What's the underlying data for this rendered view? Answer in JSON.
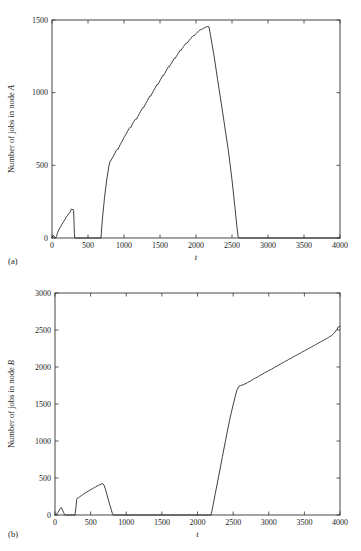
{
  "figure": {
    "panels": [
      {
        "caption": "(a)",
        "name": "panel-a"
      },
      {
        "caption": "(b)",
        "name": "panel-b"
      }
    ]
  },
  "chart_data": [
    {
      "type": "line",
      "title": "",
      "xlabel": "t",
      "ylabel": "Number of jobs in node A",
      "ylabel_parts": {
        "prefix": "Number of jobs in node ",
        "italic": "A"
      },
      "xlim": [
        0,
        4000
      ],
      "ylim": [
        0,
        1500
      ],
      "xticks": [
        0,
        500,
        1000,
        1500,
        2000,
        2500,
        3000,
        3500,
        4000
      ],
      "yticks": [
        0,
        500,
        1000,
        1500
      ],
      "xticklabels": [
        "0",
        "500",
        "1000",
        "1500",
        "2000",
        "2500",
        "3000",
        "3500",
        "4000"
      ],
      "yticklabels": [
        "0",
        "500",
        "1000",
        "1500"
      ],
      "grid": false,
      "legend": "none",
      "series": [
        {
          "name": "jobs-in-node-A",
          "color": "#2a2a2a",
          "points": [
            [
              0,
              0
            ],
            [
              20,
              18
            ],
            [
              40,
              5
            ],
            [
              55,
              2
            ],
            [
              62,
              10
            ],
            [
              80,
              40
            ],
            [
              100,
              62
            ],
            [
              120,
              78
            ],
            [
              140,
              96
            ],
            [
              160,
              112
            ],
            [
              180,
              128
            ],
            [
              200,
              145
            ],
            [
              215,
              155
            ],
            [
              230,
              168
            ],
            [
              245,
              172
            ],
            [
              255,
              182
            ],
            [
              265,
              196
            ],
            [
              275,
              200
            ],
            [
              285,
              192
            ],
            [
              292,
              198
            ],
            [
              300,
              190
            ],
            [
              305,
              120
            ],
            [
              310,
              40
            ],
            [
              315,
              5
            ],
            [
              320,
              0
            ],
            [
              400,
              0
            ],
            [
              500,
              0
            ],
            [
              600,
              0
            ],
            [
              660,
              0
            ],
            [
              680,
              0
            ],
            [
              700,
              130
            ],
            [
              730,
              280
            ],
            [
              760,
              400
            ],
            [
              790,
              495
            ],
            [
              805,
              528
            ],
            [
              815,
              530
            ],
            [
              830,
              545
            ],
            [
              850,
              560
            ],
            [
              870,
              580
            ],
            [
              890,
              600
            ],
            [
              905,
              610
            ],
            [
              915,
              608
            ],
            [
              930,
              625
            ],
            [
              950,
              645
            ],
            [
              970,
              662
            ],
            [
              990,
              682
            ],
            [
              1010,
              700
            ],
            [
              1030,
              716
            ],
            [
              1050,
              735
            ],
            [
              1070,
              752
            ],
            [
              1085,
              762
            ],
            [
              1095,
              760
            ],
            [
              1110,
              778
            ],
            [
              1130,
              796
            ],
            [
              1150,
              812
            ],
            [
              1165,
              820
            ],
            [
              1175,
              818
            ],
            [
              1190,
              834
            ],
            [
              1210,
              852
            ],
            [
              1230,
              870
            ],
            [
              1250,
              888
            ],
            [
              1262,
              898
            ],
            [
              1272,
              896
            ],
            [
              1285,
              910
            ],
            [
              1305,
              928
            ],
            [
              1325,
              946
            ],
            [
              1345,
              964
            ],
            [
              1360,
              978
            ],
            [
              1370,
              976
            ],
            [
              1385,
              990
            ],
            [
              1405,
              1008
            ],
            [
              1425,
              1026
            ],
            [
              1445,
              1044
            ],
            [
              1460,
              1058
            ],
            [
              1470,
              1055
            ],
            [
              1485,
              1070
            ],
            [
              1505,
              1088
            ],
            [
              1525,
              1106
            ],
            [
              1540,
              1120
            ],
            [
              1550,
              1118
            ],
            [
              1565,
              1132
            ],
            [
              1585,
              1150
            ],
            [
              1605,
              1168
            ],
            [
              1620,
              1180
            ],
            [
              1630,
              1178
            ],
            [
              1645,
              1192
            ],
            [
              1665,
              1208
            ],
            [
              1685,
              1225
            ],
            [
              1700,
              1238
            ],
            [
              1712,
              1236
            ],
            [
              1725,
              1248
            ],
            [
              1745,
              1264
            ],
            [
              1765,
              1280
            ],
            [
              1780,
              1292
            ],
            [
              1792,
              1290
            ],
            [
              1805,
              1302
            ],
            [
              1825,
              1316
            ],
            [
              1845,
              1330
            ],
            [
              1860,
              1340
            ],
            [
              1872,
              1338
            ],
            [
              1885,
              1348
            ],
            [
              1905,
              1360
            ],
            [
              1925,
              1372
            ],
            [
              1945,
              1384
            ],
            [
              1960,
              1392
            ],
            [
              1972,
              1390
            ],
            [
              1985,
              1398
            ],
            [
              2005,
              1408
            ],
            [
              2025,
              1418
            ],
            [
              2045,
              1428
            ],
            [
              2060,
              1434
            ],
            [
              2075,
              1432
            ],
            [
              2090,
              1438
            ],
            [
              2110,
              1444
            ],
            [
              2130,
              1450
            ],
            [
              2150,
              1453
            ],
            [
              2165,
              1455
            ],
            [
              2180,
              1453
            ],
            [
              2200,
              1400
            ],
            [
              2250,
              1255
            ],
            [
              2300,
              1090
            ],
            [
              2350,
              930
            ],
            [
              2400,
              765
            ],
            [
              2450,
              600
            ],
            [
              2500,
              400
            ],
            [
              2540,
              215
            ],
            [
              2570,
              70
            ],
            [
              2585,
              8
            ],
            [
              2595,
              0
            ],
            [
              2700,
              0
            ],
            [
              3000,
              0
            ],
            [
              3500,
              0
            ],
            [
              4000,
              0
            ]
          ]
        }
      ]
    },
    {
      "type": "line",
      "title": "",
      "xlabel": "t",
      "ylabel": "Number of jobs in node B",
      "ylabel_parts": {
        "prefix": "Number of jobs in node ",
        "italic": "B"
      },
      "xlim": [
        0,
        4000
      ],
      "ylim": [
        0,
        3000
      ],
      "xticks": [
        0,
        500,
        1000,
        1500,
        2000,
        2500,
        3000,
        3500,
        4000
      ],
      "yticks": [
        0,
        500,
        1000,
        1500,
        2000,
        2500,
        3000
      ],
      "xticklabels": [
        "0",
        "500",
        "1000",
        "1500",
        "2000",
        "2500",
        "3000",
        "3500",
        "4000"
      ],
      "yticklabels": [
        "0",
        "500",
        "1000",
        "1500",
        "2000",
        "2500",
        "3000"
      ],
      "grid": false,
      "legend": "none",
      "series": [
        {
          "name": "jobs-in-node-B",
          "color": "#2a2a2a",
          "points": [
            [
              0,
              0
            ],
            [
              30,
              20
            ],
            [
              55,
              55
            ],
            [
              75,
              90
            ],
            [
              90,
              98
            ],
            [
              105,
              70
            ],
            [
              120,
              35
            ],
            [
              132,
              8
            ],
            [
              140,
              0
            ],
            [
              200,
              0
            ],
            [
              260,
              0
            ],
            [
              280,
              0
            ],
            [
              295,
              110
            ],
            [
              305,
              210
            ],
            [
              315,
              228
            ],
            [
              330,
              232
            ],
            [
              350,
              248
            ],
            [
              370,
              262
            ],
            [
              390,
              276
            ],
            [
              410,
              290
            ],
            [
              430,
              302
            ],
            [
              450,
              312
            ],
            [
              470,
              324
            ],
            [
              490,
              336
            ],
            [
              510,
              348
            ],
            [
              530,
              358
            ],
            [
              550,
              368
            ],
            [
              570,
              380
            ],
            [
              590,
              392
            ],
            [
              610,
              400
            ],
            [
              630,
              410
            ],
            [
              650,
              418
            ],
            [
              665,
              424
            ],
            [
              675,
              420
            ],
            [
              690,
              400
            ],
            [
              710,
              340
            ],
            [
              730,
              272
            ],
            [
              750,
              200
            ],
            [
              770,
              135
            ],
            [
              790,
              70
            ],
            [
              805,
              22
            ],
            [
              815,
              2
            ],
            [
              822,
              0
            ],
            [
              900,
              0
            ],
            [
              1000,
              0
            ],
            [
              1200,
              0
            ],
            [
              1500,
              0
            ],
            [
              1800,
              0
            ],
            [
              2000,
              0
            ],
            [
              2150,
              0
            ],
            [
              2190,
              0
            ],
            [
              2210,
              90
            ],
            [
              2250,
              290
            ],
            [
              2300,
              540
            ],
            [
              2350,
              790
            ],
            [
              2400,
              1040
            ],
            [
              2450,
              1280
            ],
            [
              2500,
              1490
            ],
            [
              2550,
              1680
            ],
            [
              2580,
              1738
            ],
            [
              2600,
              1748
            ],
            [
              2640,
              1760
            ],
            [
              2680,
              1778
            ],
            [
              2700,
              1788
            ],
            [
              2720,
              1800
            ],
            [
              2740,
              1808
            ],
            [
              2760,
              1820
            ],
            [
              2780,
              1832
            ],
            [
              2800,
              1845
            ],
            [
              2820,
              1855
            ],
            [
              2840,
              1862
            ],
            [
              2860,
              1875
            ],
            [
              2880,
              1888
            ],
            [
              2900,
              1898
            ],
            [
              2920,
              1908
            ],
            [
              2940,
              1920
            ],
            [
              2960,
              1930
            ],
            [
              2980,
              1940
            ],
            [
              3000,
              1952
            ],
            [
              3020,
              1962
            ],
            [
              3040,
              1970
            ],
            [
              3060,
              1982
            ],
            [
              3080,
              1995
            ],
            [
              3100,
              2005
            ],
            [
              3120,
              2015
            ],
            [
              3140,
              2026
            ],
            [
              3160,
              2038
            ],
            [
              3180,
              2048
            ],
            [
              3200,
              2058
            ],
            [
              3220,
              2070
            ],
            [
              3240,
              2080
            ],
            [
              3260,
              2090
            ],
            [
              3280,
              2102
            ],
            [
              3300,
              2112
            ],
            [
              3320,
              2122
            ],
            [
              3340,
              2134
            ],
            [
              3360,
              2145
            ],
            [
              3380,
              2155
            ],
            [
              3400,
              2165
            ],
            [
              3420,
              2176
            ],
            [
              3440,
              2186
            ],
            [
              3460,
              2198
            ],
            [
              3480,
              2208
            ],
            [
              3500,
              2218
            ],
            [
              3520,
              2228
            ],
            [
              3540,
              2240
            ],
            [
              3560,
              2250
            ],
            [
              3580,
              2260
            ],
            [
              3600,
              2272
            ],
            [
              3620,
              2282
            ],
            [
              3640,
              2292
            ],
            [
              3660,
              2304
            ],
            [
              3680,
              2314
            ],
            [
              3700,
              2324
            ],
            [
              3720,
              2336
            ],
            [
              3740,
              2346
            ],
            [
              3760,
              2356
            ],
            [
              3780,
              2368
            ],
            [
              3800,
              2378
            ],
            [
              3820,
              2388
            ],
            [
              3840,
              2400
            ],
            [
              3860,
              2412
            ],
            [
              3880,
              2424
            ],
            [
              3900,
              2440
            ],
            [
              3920,
              2460
            ],
            [
              3940,
              2488
            ],
            [
              3960,
              2512
            ],
            [
              3975,
              2540
            ],
            [
              3988,
              2550
            ],
            [
              4000,
              2545
            ]
          ]
        }
      ]
    }
  ]
}
